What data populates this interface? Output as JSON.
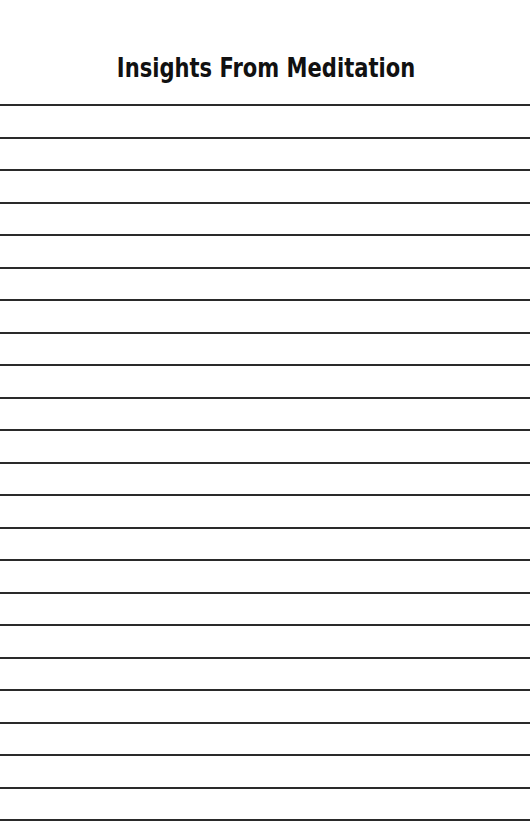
{
  "page": {
    "title": "Insights From Meditation",
    "line_color": "#2a2a2a",
    "background": "#ffffff",
    "rules": {
      "count": 23,
      "first_y": 104,
      "spacing": 32.5
    }
  }
}
